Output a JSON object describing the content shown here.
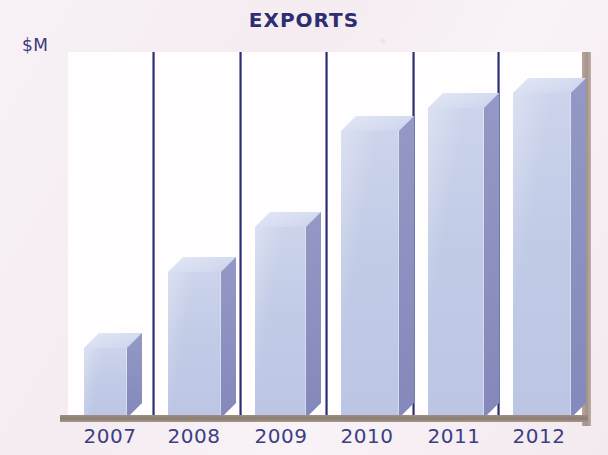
{
  "chart_data": {
    "type": "bar",
    "title": "EXPORTS",
    "subtitle": "",
    "xlabel": "",
    "ylabel": "$M",
    "categories": [
      "2007",
      "2008",
      "2009",
      "2010",
      "2011",
      "2012"
    ],
    "values": [
      70,
      146,
      191,
      287,
      310,
      325
    ],
    "ylim": [
      0,
      366
    ],
    "grid": false,
    "legend": null,
    "legend_position": "none",
    "axis_ticks_visible": false,
    "style": {
      "bar_front_color": "#c4cde7",
      "bar_side_color": "#8d91c1",
      "bar_top_color": "#dde3f3",
      "title_color": "#2d2d72",
      "tick_label_color": "#3b3f83",
      "separator_color": "#2b2f72",
      "baseline_color": "#8d7e73",
      "panel_color": "#fffdfd",
      "background_color": "#f5eef2"
    }
  },
  "layout": {
    "plot": {
      "left": 68,
      "top": 52,
      "width": 514,
      "height": 366
    },
    "bar_depth": 15,
    "bar_slots": [
      {
        "x": 84,
        "w": 43
      },
      {
        "x": 168,
        "w": 53
      },
      {
        "x": 255,
        "w": 51
      },
      {
        "x": 341,
        "w": 58
      },
      {
        "x": 428,
        "w": 56
      },
      {
        "x": 513,
        "w": 58
      }
    ],
    "separators_x": [
      152,
      239,
      325,
      412,
      497
    ],
    "tick_label_x": [
      84,
      168,
      255,
      341,
      428,
      513
    ],
    "tick_label_w": 64
  }
}
